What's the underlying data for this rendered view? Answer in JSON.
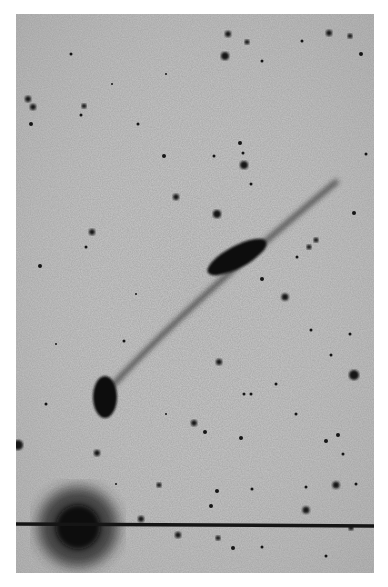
{
  "image": {
    "description": "Negative (inverted) astronomical photographic plate showing a star field with a long faint jet/tail connecting an elongated galaxy to a compact elliptical object, with a bright saturated star and diffraction line at bottom left",
    "background_color": "#c8c8c8",
    "object_color": "#101010",
    "frame_color": "#ffffff"
  },
  "features": {
    "galaxy": {
      "cx": 221,
      "cy": 243,
      "rx": 32,
      "ry": 11,
      "rotate": -28
    },
    "compact_object": {
      "cx": 89,
      "cy": 383,
      "rx": 12,
      "ry": 21,
      "rotate": 0
    },
    "jet_path": "M 100 370 Q 170 290 320 170",
    "bright_star": {
      "cx": 62,
      "cy": 515,
      "r": 30
    },
    "diffraction_line_y": 510
  },
  "stars": [
    [
      212,
      20,
      3
    ],
    [
      231,
      28,
      2.5
    ],
    [
      313,
      19,
      3
    ],
    [
      334,
      22,
      2.5
    ],
    [
      345,
      40,
      2
    ],
    [
      286,
      27,
      1.5
    ],
    [
      209,
      42,
      4
    ],
    [
      246,
      47,
      1.5
    ],
    [
      12,
      85,
      3
    ],
    [
      17,
      93,
      3
    ],
    [
      15,
      110,
      2
    ],
    [
      68,
      92,
      2.5
    ],
    [
      65,
      101,
      1.5
    ],
    [
      122,
      110,
      1.5
    ],
    [
      224,
      129,
      2
    ],
    [
      227,
      139,
      1.5
    ],
    [
      228,
      151,
      4
    ],
    [
      148,
      142,
      2
    ],
    [
      198,
      142,
      1.5
    ],
    [
      160,
      183,
      3
    ],
    [
      201,
      200,
      4
    ],
    [
      235,
      170,
      1.5
    ],
    [
      76,
      218,
      3
    ],
    [
      70,
      233,
      1.5
    ],
    [
      24,
      252,
      2
    ],
    [
      300,
      226,
      2.5
    ],
    [
      293,
      233,
      2.5
    ],
    [
      338,
      199,
      2
    ],
    [
      281,
      243,
      1.5
    ],
    [
      269,
      283,
      3.5
    ],
    [
      295,
      316,
      1.5
    ],
    [
      246,
      265,
      2
    ],
    [
      203,
      348,
      3
    ],
    [
      108,
      327,
      1.5
    ],
    [
      235,
      380,
      1.5
    ],
    [
      178,
      409,
      3
    ],
    [
      189,
      418,
      2
    ],
    [
      225,
      424,
      2
    ],
    [
      228,
      380,
      1.5
    ],
    [
      338,
      361,
      5
    ],
    [
      315,
      341,
      1.5
    ],
    [
      334,
      320,
      1.5
    ],
    [
      310,
      427,
      2
    ],
    [
      322,
      421,
      2
    ],
    [
      327,
      440,
      1.5
    ],
    [
      2,
      431,
      5
    ],
    [
      81,
      439,
      3
    ],
    [
      143,
      471,
      2.5
    ],
    [
      201,
      477,
      2
    ],
    [
      195,
      492,
      2
    ],
    [
      236,
      475,
      1.5
    ],
    [
      320,
      471,
      3.5
    ],
    [
      290,
      496,
      3.5
    ],
    [
      335,
      514,
      2.5
    ],
    [
      125,
      505,
      3
    ],
    [
      162,
      521,
      3
    ],
    [
      202,
      524,
      2.5
    ],
    [
      217,
      534,
      2
    ],
    [
      246,
      533,
      1.5
    ],
    [
      310,
      542,
      1.5
    ],
    [
      290,
      473,
      1.5
    ],
    [
      55,
      40,
      1.5
    ],
    [
      96,
      70,
      1
    ],
    [
      150,
      60,
      1
    ],
    [
      350,
      140,
      1.5
    ],
    [
      260,
      370,
      1.5
    ],
    [
      120,
      280,
      1
    ],
    [
      40,
      330,
      1
    ],
    [
      30,
      390,
      1.5
    ],
    [
      150,
      400,
      1
    ],
    [
      280,
      400,
      1.5
    ],
    [
      340,
      470,
      1.5
    ],
    [
      100,
      470,
      1
    ]
  ]
}
